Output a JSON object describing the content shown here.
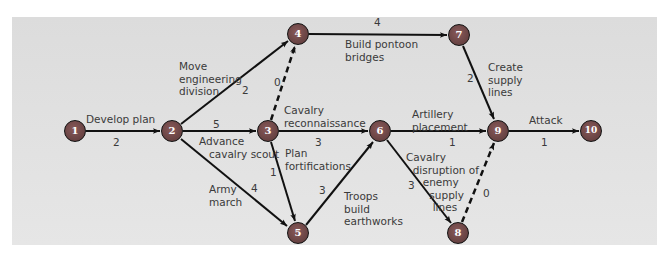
{
  "diagram": {
    "type": "activity-on-arrow network (PERT/CPM)",
    "colors": {
      "background_panel": "#e0e0e0",
      "node_fill": "#6b4545",
      "node_outline": "#111111",
      "node_text": "#ffffff",
      "arrow": "#111111",
      "label_text": "#3a3a3a"
    },
    "nodes": [
      {
        "id": "1",
        "label": "1",
        "x": 75,
        "y": 131
      },
      {
        "id": "2",
        "label": "2",
        "x": 172,
        "y": 131
      },
      {
        "id": "3",
        "label": "3",
        "x": 268,
        "y": 131
      },
      {
        "id": "4",
        "label": "4",
        "x": 298,
        "y": 34
      },
      {
        "id": "5",
        "label": "5",
        "x": 298,
        "y": 233
      },
      {
        "id": "6",
        "label": "6",
        "x": 380,
        "y": 131
      },
      {
        "id": "7",
        "label": "7",
        "x": 459,
        "y": 35
      },
      {
        "id": "8",
        "label": "8",
        "x": 458,
        "y": 233
      },
      {
        "id": "9",
        "label": "9",
        "x": 498,
        "y": 131
      },
      {
        "id": "10",
        "label": "10",
        "x": 591,
        "y": 131
      }
    ],
    "activities": [
      {
        "from": "1",
        "to": "2",
        "name": "Develop plan",
        "duration": "2",
        "dummy": false
      },
      {
        "from": "2",
        "to": "4",
        "name": "Move\nengineering\ndivision",
        "duration": "2",
        "dummy": false
      },
      {
        "from": "2",
        "to": "3",
        "name": "Advance\n   cavalry scout",
        "duration": "5",
        "dummy": false
      },
      {
        "from": "2",
        "to": "5",
        "name": "Army\nmarch",
        "duration": "4",
        "dummy": false
      },
      {
        "from": "3",
        "to": "4",
        "name": "",
        "duration": "0",
        "dummy": true
      },
      {
        "from": "3",
        "to": "6",
        "name": "Cavalry\nreconnaissance",
        "duration": "3",
        "dummy": false
      },
      {
        "from": "3",
        "to": "5",
        "name": "Plan\nfortifications",
        "duration": "1",
        "dummy": false
      },
      {
        "from": "4",
        "to": "7",
        "name": "Build pontoon\nbridges",
        "duration": "4",
        "dummy": false
      },
      {
        "from": "5",
        "to": "6",
        "name": "Troops\nbuild\nearthworks",
        "duration": "3",
        "dummy": false
      },
      {
        "from": "6",
        "to": "9",
        "name": "Artillery\nplacement",
        "duration": "1",
        "dummy": false
      },
      {
        "from": "6",
        "to": "8",
        "name": "Cavalry\n  disruption of\n     enemy\n       supply\n        lines",
        "duration": "3",
        "dummy": false
      },
      {
        "from": "7",
        "to": "9",
        "name": "Create\nsupply\nlines",
        "duration": "2",
        "dummy": false
      },
      {
        "from": "8",
        "to": "9",
        "name": "",
        "duration": "0",
        "dummy": true
      },
      {
        "from": "9",
        "to": "10",
        "name": "Attack",
        "duration": "1",
        "dummy": false
      }
    ]
  },
  "labels": {
    "a12": "Develop plan",
    "d12": "2",
    "a24": "Move\nengineering\ndivision",
    "d24": "2",
    "a23": "Advance\n   cavalry scout",
    "d23": "5",
    "a25": "Army\nmarch",
    "d25": "4",
    "d34": "0",
    "a36": "Cavalry\nreconnaissance",
    "d36": "3",
    "a35": "Plan\nfortifications",
    "d35": "1",
    "a47": "Build pontoon\nbridges",
    "d47": "4",
    "a56": "Troops\nbuild\nearthworks",
    "d56": "3",
    "a69": "Artillery\nplacement",
    "d69": "1",
    "a68": "Cavalry\n  disruption of\n     enemy\n       supply\n        lines",
    "d68": "3",
    "a79": "Create\nsupply\nlines",
    "d79": "2",
    "d89": "0",
    "a910": "Attack",
    "d910": "1"
  }
}
